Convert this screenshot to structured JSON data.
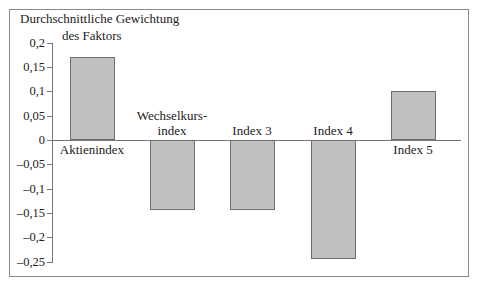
{
  "chart_data": {
    "type": "bar",
    "title_lines": [
      "Durchschnittliche Gewichtung",
      "des Faktors"
    ],
    "categories": [
      "Aktienindex",
      "Wechselkurs-index",
      "Index 3",
      "Index 4",
      "Index 5"
    ],
    "category_lines": [
      [
        "Aktienindex"
      ],
      [
        "Wechselkurs-",
        "index"
      ],
      [
        "Index 3"
      ],
      [
        "Index 4"
      ],
      [
        "Index 5"
      ]
    ],
    "values": [
      0.17,
      -0.145,
      -0.145,
      -0.245,
      0.1
    ],
    "xlabel": "",
    "ylabel": "Durchschnittliche Gewichtung des Faktors",
    "ylim": [
      -0.25,
      0.2
    ],
    "yticks": [
      0.2,
      0.15,
      0.1,
      0.05,
      0,
      -0.05,
      -0.1,
      -0.15,
      -0.2,
      -0.25
    ],
    "ytick_labels": [
      "0,2",
      "0,15",
      "0,1",
      "0,05",
      "0",
      "–0,05",
      "–0,1",
      "–0,15",
      "–0,2",
      "–0,25"
    ],
    "grid": false,
    "legend": null,
    "bar_color": "#c0c0c0",
    "bar_edge_color": "#6e6e6e"
  }
}
